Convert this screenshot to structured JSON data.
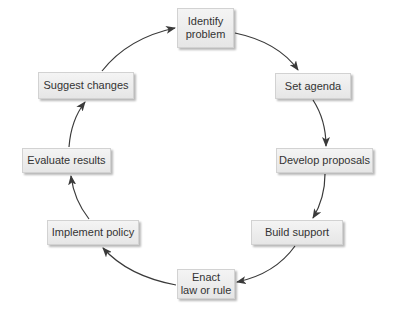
{
  "diagram": {
    "type": "cycle",
    "line_color": "#3a3a3a",
    "nodes": [
      {
        "id": "identify",
        "label": "Identify\nproblem"
      },
      {
        "id": "agenda",
        "label": "Set agenda"
      },
      {
        "id": "proposals",
        "label": "Develop proposals"
      },
      {
        "id": "support",
        "label": "Build support"
      },
      {
        "id": "enact",
        "label": "Enact\nlaw or rule"
      },
      {
        "id": "implement",
        "label": "Implement policy"
      },
      {
        "id": "evaluate",
        "label": "Evaluate results"
      },
      {
        "id": "suggest",
        "label": "Suggest changes"
      }
    ],
    "edges": [
      {
        "from": "identify",
        "to": "agenda"
      },
      {
        "from": "agenda",
        "to": "proposals"
      },
      {
        "from": "proposals",
        "to": "support"
      },
      {
        "from": "support",
        "to": "enact"
      },
      {
        "from": "enact",
        "to": "implement"
      },
      {
        "from": "implement",
        "to": "evaluate"
      },
      {
        "from": "evaluate",
        "to": "suggest"
      },
      {
        "from": "suggest",
        "to": "identify"
      }
    ]
  }
}
